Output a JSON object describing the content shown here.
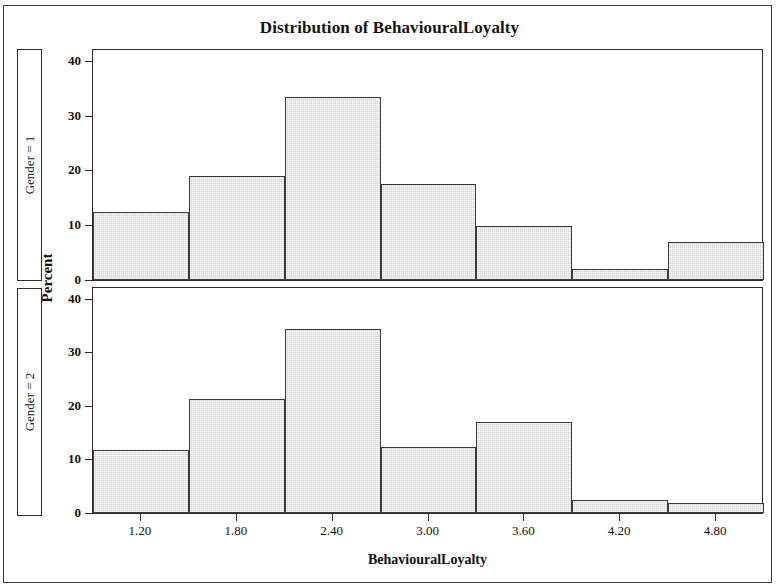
{
  "chart_data": {
    "type": "bar",
    "title": "Distribution of BehaviouralLoyalty",
    "xlabel": "BehaviouralLoyalty",
    "ylabel": "Percent",
    "grid": false,
    "legend": "none",
    "layout": "2 stacked panels sharing one x-axis",
    "xlim": [
      0.9,
      5.1
    ],
    "ylim": [
      0,
      42
    ],
    "yticks": [
      0,
      10,
      20,
      30,
      40
    ],
    "ytick_labels": [
      "0",
      "10",
      "20",
      "30",
      "40"
    ],
    "xticks": [
      1.2,
      1.8,
      2.4,
      3.0,
      3.6,
      4.2,
      4.8
    ],
    "xtick_labels": [
      "1.20",
      "1.80",
      "2.40",
      "3.00",
      "3.60",
      "4.20",
      "4.80"
    ],
    "bin_width": 0.6,
    "bin_centers": [
      1.2,
      1.8,
      2.4,
      3.0,
      3.6,
      4.2,
      4.8
    ],
    "bin_edges": [
      0.9,
      1.5,
      2.1,
      2.7,
      3.3,
      3.9,
      4.5,
      5.1
    ],
    "panels": [
      {
        "label": "Gender = 1",
        "values": [
          12.5,
          19.0,
          33.5,
          17.5,
          9.9,
          2.0,
          7.0
        ]
      },
      {
        "label": "Gender = 2",
        "values": [
          11.8,
          21.2,
          34.3,
          12.4,
          17.0,
          2.4,
          1.8
        ]
      }
    ],
    "bar_fill_color": "#e2e2e2",
    "bar_edge_color": "#3b3b3b"
  }
}
